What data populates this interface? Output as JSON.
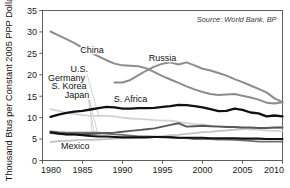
{
  "chart_data": {
    "type": "line",
    "title": "",
    "subtitle": "",
    "xlabel": "",
    "ylabel": "Thousand Btus per Constant 2005 PPP Dollar",
    "xlim": [
      1980,
      2010
    ],
    "ylim": [
      0,
      35
    ],
    "grid": false,
    "legend_position": "inline-labels",
    "source_note": "Source: World Bank, BP",
    "x_ticks": [
      "1980",
      "1985",
      "1990",
      "1995",
      "2000",
      "2005",
      "2010"
    ],
    "x_tick_values": [
      1980,
      1985,
      1990,
      1995,
      2000,
      2005,
      2010
    ],
    "y_ticks": [
      "0",
      "5",
      "10",
      "15",
      "20",
      "25",
      "30",
      "35"
    ],
    "y_tick_values": [
      0,
      5,
      10,
      15,
      20,
      25,
      30,
      35
    ],
    "annotations": [
      {
        "text": "China",
        "x": 1986.2,
        "y": 25.0
      },
      {
        "text": "Russia",
        "x": 1995.0,
        "y": 23.2
      },
      {
        "text": "U.S.",
        "x": 1984.6,
        "y": 20.6
      },
      {
        "text": "Germany",
        "x": 1983.0,
        "y": 18.6
      },
      {
        "text": "S. Korea",
        "x": 1983.3,
        "y": 16.6
      },
      {
        "text": "Japan",
        "x": 1984.3,
        "y": 14.6
      },
      {
        "text": "S. Africa",
        "x": 1991.0,
        "y": 13.6
      },
      {
        "text": "Mexico",
        "x": 1984.1,
        "y": 2.6
      }
    ],
    "series": [
      {
        "name": "China",
        "color": "#8c8c8c",
        "width": 2.0,
        "x": [
          1981,
          1982,
          1983,
          1984,
          1985,
          1986,
          1987,
          1988,
          1989,
          1990,
          1991,
          1992,
          1993,
          1994,
          1995,
          1996,
          1997,
          1998,
          1999,
          2000,
          2001,
          2002,
          2003,
          2004,
          2005,
          2006,
          2007,
          2008,
          2009,
          2010
        ],
        "values": [
          30.1,
          29.2,
          28.3,
          27.4,
          26.3,
          25.2,
          24.3,
          23.4,
          22.6,
          22.2,
          22.1,
          22.0,
          21.5,
          20.6,
          19.7,
          18.9,
          18.1,
          17.3,
          16.6,
          16.0,
          15.5,
          15.3,
          15.4,
          15.5,
          15.1,
          14.7,
          14.2,
          13.5,
          13.3,
          13.6
        ]
      },
      {
        "name": "Russia",
        "color": "#8c8c8c",
        "width": 2.0,
        "x": [
          1989,
          1990,
          1991,
          1992,
          1993,
          1994,
          1995,
          1996,
          1997,
          1998,
          1999,
          2000,
          2001,
          2002,
          2003,
          2004,
          2005,
          2006,
          2007,
          2008,
          2009,
          2010
        ],
        "values": [
          18.2,
          18.2,
          18.8,
          19.9,
          21.0,
          21.9,
          22.6,
          22.9,
          22.4,
          22.9,
          22.2,
          21.4,
          21.0,
          20.4,
          19.8,
          19.0,
          18.3,
          17.5,
          16.7,
          15.9,
          14.5,
          13.6
        ]
      },
      {
        "name": "S. Africa",
        "color": "#111111",
        "width": 2.3,
        "x": [
          1981,
          1982,
          1983,
          1984,
          1985,
          1986,
          1987,
          1988,
          1989,
          1990,
          1991,
          1992,
          1993,
          1994,
          1995,
          1996,
          1997,
          1998,
          1999,
          2000,
          2001,
          2002,
          2003,
          2004,
          2005,
          2006,
          2007,
          2008,
          2009,
          2010
        ],
        "values": [
          10.2,
          10.7,
          11.1,
          11.4,
          11.6,
          11.9,
          12.2,
          12.5,
          12.4,
          12.1,
          12.1,
          12.2,
          12.2,
          12.3,
          12.5,
          12.7,
          13.0,
          12.9,
          12.7,
          12.4,
          12.0,
          11.5,
          11.6,
          12.1,
          11.8,
          11.2,
          11.0,
          10.3,
          10.5,
          10.3
        ]
      },
      {
        "name": "U.S.",
        "color": "#d2d2d2",
        "width": 1.8,
        "x": [
          1981,
          1982,
          1983,
          1984,
          1985,
          1986,
          1987,
          1988,
          1989,
          1990,
          1991,
          1992,
          1993,
          1994,
          1995,
          1996,
          1997,
          1998,
          1999,
          2000,
          2001,
          2002,
          2003,
          2004,
          2005,
          2006,
          2007,
          2008,
          2009,
          2010
        ],
        "values": [
          12.0,
          11.6,
          11.1,
          10.9,
          10.6,
          10.4,
          10.4,
          10.4,
          10.3,
          10.0,
          9.8,
          9.7,
          9.6,
          9.4,
          9.3,
          9.3,
          9.0,
          8.7,
          8.5,
          8.4,
          8.1,
          8.0,
          7.9,
          7.8,
          7.5,
          7.2,
          7.2,
          7.0,
          6.9,
          6.9
        ]
      },
      {
        "name": "Germany",
        "color": "#6e6e6e",
        "width": 1.8,
        "x": [
          1981,
          1982,
          1983,
          1984,
          1985,
          1986,
          1987,
          1988,
          1989,
          1990,
          1991,
          1992,
          1993,
          1994,
          1995,
          1996,
          1997,
          1998,
          1999,
          2000,
          2001,
          2002,
          2003,
          2004,
          2005,
          2006,
          2007,
          2008,
          2009,
          2010
        ],
        "values": [
          6.8,
          6.6,
          6.5,
          6.5,
          6.5,
          6.5,
          6.5,
          6.3,
          6.1,
          6.0,
          5.8,
          5.6,
          5.6,
          5.5,
          5.4,
          5.5,
          5.3,
          5.2,
          5.0,
          5.0,
          5.0,
          4.9,
          4.9,
          4.8,
          4.7,
          4.6,
          4.4,
          4.4,
          4.4,
          4.4
        ]
      },
      {
        "name": "S. Korea",
        "color": "#585858",
        "width": 1.9,
        "x": [
          1981,
          1982,
          1983,
          1984,
          1985,
          1986,
          1987,
          1988,
          1989,
          1990,
          1991,
          1992,
          1993,
          1994,
          1995,
          1996,
          1997,
          1998,
          1999,
          2000,
          2001,
          2002,
          2003,
          2004,
          2005,
          2006,
          2007,
          2008,
          2009,
          2010
        ],
        "values": [
          6.4,
          6.2,
          6.1,
          6.1,
          6.2,
          6.2,
          6.3,
          6.4,
          6.5,
          6.7,
          6.9,
          7.1,
          7.3,
          7.5,
          7.9,
          8.3,
          8.7,
          7.9,
          8.0,
          8.1,
          8.0,
          7.9,
          7.8,
          7.8,
          7.7,
          7.7,
          7.6,
          7.6,
          7.7,
          7.7
        ]
      },
      {
        "name": "Japan",
        "color": "#111111",
        "width": 2.1,
        "x": [
          1981,
          1982,
          1983,
          1984,
          1985,
          1986,
          1987,
          1988,
          1989,
          1990,
          1991,
          1992,
          1993,
          1994,
          1995,
          1996,
          1997,
          1998,
          1999,
          2000,
          2001,
          2002,
          2003,
          2004,
          2005,
          2006,
          2007,
          2008,
          2009,
          2010
        ],
        "values": [
          6.6,
          6.3,
          6.1,
          6.1,
          5.9,
          5.7,
          5.6,
          5.6,
          5.5,
          5.4,
          5.4,
          5.4,
          5.4,
          5.5,
          5.5,
          5.4,
          5.3,
          5.3,
          5.3,
          5.3,
          5.2,
          5.2,
          5.2,
          5.2,
          5.1,
          5.1,
          5.1,
          5.0,
          5.0,
          5.0
        ]
      },
      {
        "name": "Mexico",
        "color": "#c2c2c2",
        "width": 1.8,
        "x": [
          1981,
          1982,
          1983,
          1984,
          1985,
          1986,
          1987,
          1988,
          1989,
          1990,
          1991,
          1992,
          1993,
          1994,
          1995,
          1996,
          1997,
          1998,
          1999,
          2000,
          2001,
          2002,
          2003,
          2004,
          2005,
          2006,
          2007,
          2008,
          2009,
          2010
        ],
        "values": [
          4.3,
          4.5,
          4.6,
          4.7,
          4.8,
          4.8,
          4.9,
          5.0,
          5.1,
          5.2,
          5.3,
          5.4,
          5.5,
          5.6,
          5.7,
          5.9,
          6.0,
          6.2,
          6.4,
          6.6,
          6.7,
          6.9,
          7.0,
          7.2,
          7.3,
          7.4,
          7.5,
          7.6,
          7.6,
          7.7
        ]
      }
    ],
    "leader_lines": [
      {
        "from": [
          1985.55,
          20.2
        ],
        "to": [
          1987.1,
          10.0
        ],
        "series": "U.S."
      },
      {
        "from": [
          1985.3,
          18.2
        ],
        "to": [
          1986.5,
          6.4
        ],
        "series": "Germany"
      },
      {
        "from": [
          1985.6,
          16.2
        ],
        "to": [
          1986.9,
          6.2
        ],
        "series": "S. Korea"
      },
      {
        "from": [
          1985.9,
          14.2
        ],
        "to": [
          1986.2,
          5.8
        ],
        "series": "Japan"
      }
    ]
  }
}
